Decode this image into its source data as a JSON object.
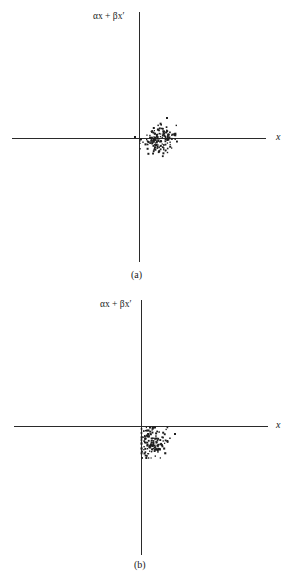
{
  "chart_data": [
    {
      "type": "scatter",
      "panel": "a",
      "caption": "(a)",
      "ylabel": "αx + βx′",
      "xlabel": "x",
      "title": "",
      "grid": false,
      "cluster": {
        "description": "Point cloud centered slightly right of the vertical axis and straddling the horizontal axis",
        "center_px": [
          159,
          139
        ],
        "spread_px": [
          8,
          7
        ],
        "count": 160,
        "outliers_px": [
          [
            167,
            118
          ],
          [
            135,
            137
          ]
        ]
      },
      "layout": {
        "origin_px": [
          139,
          138
        ],
        "x_axis_px": [
          12,
          266
        ],
        "y_axis_px": [
          12,
          262
        ]
      }
    },
    {
      "type": "scatter",
      "panel": "b",
      "caption": "(b)",
      "ylabel": "αx + βx′",
      "xlabel": "x",
      "title": "",
      "grid": false,
      "cluster": {
        "description": "Point cloud lying just right of the vertical axis and entirely below the horizontal axis",
        "center_px": [
          152,
          442
        ],
        "spread_px": [
          8,
          8
        ],
        "count": 150,
        "outliers_px": [
          [
            175,
            434
          ]
        ]
      },
      "layout": {
        "origin_px": [
          141,
          426
        ],
        "x_axis_px": [
          14,
          268
        ],
        "y_axis_px": [
          300,
          555
        ]
      }
    }
  ],
  "panels": [
    {
      "ylabel": "αx + βx′",
      "xlabel": "x",
      "caption": "(a)"
    },
    {
      "ylabel": "αx + βx′",
      "xlabel": "x",
      "caption": "(b)"
    }
  ]
}
